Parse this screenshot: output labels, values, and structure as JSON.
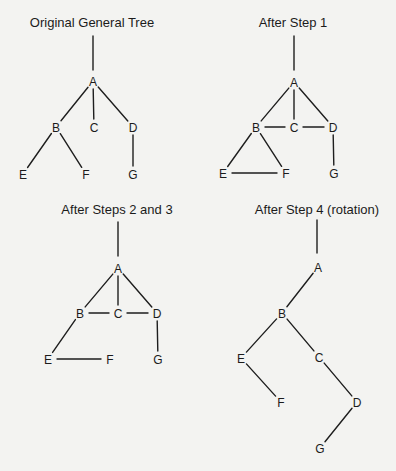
{
  "diagram": {
    "background": "#f3f3f1",
    "line_color": "#1e1e1e",
    "text_color": "#1b1b1b",
    "panels": [
      {
        "id": "original",
        "title": "Original General Tree",
        "title_pos": [
          92,
          27
        ],
        "root_stub": [
          [
            93,
            36
          ],
          [
            93,
            70
          ]
        ],
        "nodes": [
          {
            "label": "A",
            "x": 93,
            "y": 81
          },
          {
            "label": "B",
            "x": 56,
            "y": 127
          },
          {
            "label": "C",
            "x": 94,
            "y": 127
          },
          {
            "label": "D",
            "x": 133,
            "y": 127
          },
          {
            "label": "E",
            "x": 23,
            "y": 174
          },
          {
            "label": "F",
            "x": 86,
            "y": 174
          },
          {
            "label": "G",
            "x": 133,
            "y": 174
          }
        ],
        "edges": [
          [
            "A",
            "B"
          ],
          [
            "A",
            "C"
          ],
          [
            "A",
            "D"
          ],
          [
            "B",
            "E"
          ],
          [
            "B",
            "F"
          ],
          [
            "D",
            "G"
          ]
        ]
      },
      {
        "id": "step1",
        "title": "After Step 1",
        "title_pos": [
          293,
          27
        ],
        "root_stub": [
          [
            294,
            36
          ],
          [
            294,
            70
          ]
        ],
        "nodes": [
          {
            "label": "A",
            "x": 294,
            "y": 82
          },
          {
            "label": "B",
            "x": 256,
            "y": 127
          },
          {
            "label": "C",
            "x": 294,
            "y": 127
          },
          {
            "label": "D",
            "x": 333,
            "y": 127
          },
          {
            "label": "E",
            "x": 223,
            "y": 173
          },
          {
            "label": "F",
            "x": 286,
            "y": 173
          },
          {
            "label": "G",
            "x": 334,
            "y": 173
          }
        ],
        "edges": [
          [
            "A",
            "B"
          ],
          [
            "A",
            "C"
          ],
          [
            "A",
            "D"
          ],
          [
            "B",
            "C"
          ],
          [
            "C",
            "D"
          ],
          [
            "B",
            "E"
          ],
          [
            "B",
            "F"
          ],
          [
            "E",
            "F"
          ],
          [
            "D",
            "G"
          ]
        ]
      },
      {
        "id": "steps23",
        "title": "After Steps 2 and 3",
        "title_pos": [
          117,
          214
        ],
        "root_stub": [
          [
            118,
            222
          ],
          [
            118,
            256
          ]
        ],
        "nodes": [
          {
            "label": "A",
            "x": 118,
            "y": 268
          },
          {
            "label": "B",
            "x": 80,
            "y": 313
          },
          {
            "label": "C",
            "x": 118,
            "y": 313
          },
          {
            "label": "D",
            "x": 157,
            "y": 313
          },
          {
            "label": "E",
            "x": 48,
            "y": 359
          },
          {
            "label": "F",
            "x": 110,
            "y": 359
          },
          {
            "label": "G",
            "x": 158,
            "y": 359
          }
        ],
        "edges": [
          [
            "A",
            "B"
          ],
          [
            "A",
            "C"
          ],
          [
            "A",
            "D"
          ],
          [
            "B",
            "C"
          ],
          [
            "C",
            "D"
          ],
          [
            "B",
            "E"
          ],
          [
            "E",
            "F"
          ],
          [
            "D",
            "G"
          ]
        ]
      },
      {
        "id": "step4",
        "title": "After Step 4 (rotation)",
        "title_pos": [
          317,
          214
        ],
        "root_stub": [
          [
            317,
            220
          ],
          [
            317,
            253
          ]
        ],
        "nodes": [
          {
            "label": "A",
            "x": 318,
            "y": 267
          },
          {
            "label": "B",
            "x": 282,
            "y": 313
          },
          {
            "label": "C",
            "x": 319,
            "y": 357
          },
          {
            "label": "D",
            "x": 357,
            "y": 402
          },
          {
            "label": "E",
            "x": 241,
            "y": 358
          },
          {
            "label": "F",
            "x": 281,
            "y": 402
          },
          {
            "label": "G",
            "x": 320,
            "y": 448
          }
        ],
        "edges": [
          [
            "A",
            "B"
          ],
          [
            "B",
            "E"
          ],
          [
            "B",
            "C"
          ],
          [
            "E",
            "F"
          ],
          [
            "C",
            "D"
          ],
          [
            "D",
            "G"
          ]
        ]
      }
    ]
  }
}
